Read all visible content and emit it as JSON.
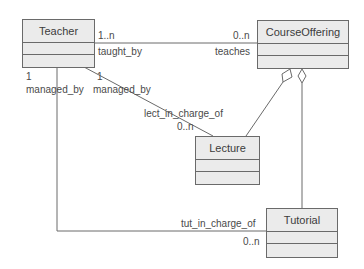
{
  "diagram": {
    "type": "uml-class",
    "classes": [
      {
        "id": "teacher",
        "name": "Teacher"
      },
      {
        "id": "course_offering",
        "name": "CourseOffering"
      },
      {
        "id": "lecture",
        "name": "Lecture"
      },
      {
        "id": "tutorial",
        "name": "Tutorial"
      }
    ],
    "associations": [
      {
        "id": "teaches",
        "from": "Teacher",
        "to": "CourseOffering",
        "from_role": "taught_by",
        "from_mult": "1..n",
        "to_role": "teaches",
        "to_mult": "0..n"
      },
      {
        "id": "lecture_assoc",
        "from": "Teacher",
        "to": "Lecture",
        "from_role": "managed_by",
        "from_mult": "1",
        "to_role": "lect_in_charge_of",
        "to_mult": "0..n"
      },
      {
        "id": "tutorial_assoc",
        "from": "Teacher",
        "to": "Tutorial",
        "from_role": "managed_by",
        "from_mult": "1",
        "to_role": "tut_in_charge_of",
        "to_mult": "0..n"
      },
      {
        "id": "agg_lecture",
        "kind": "aggregation",
        "whole": "CourseOffering",
        "part": "Lecture"
      },
      {
        "id": "agg_tutorial",
        "kind": "aggregation",
        "whole": "CourseOffering",
        "part": "Tutorial"
      }
    ]
  },
  "labels": {
    "teacher_co_mult_left": "1..n",
    "teacher_co_role_left": "taught_by",
    "teacher_co_mult_right": "0..n",
    "teacher_co_role_right": "teaches",
    "tutorial_teacher_mult": "1",
    "tutorial_teacher_role": "managed_by",
    "lecture_teacher_mult": "1",
    "lecture_teacher_role": "managed_by",
    "lecture_role": "lect_in_charge_of",
    "lecture_mult": "0..n",
    "tutorial_role": "tut_in_charge_of",
    "tutorial_mult": "0..n"
  },
  "colors": {
    "box_fill": "#ebebeb",
    "stroke": "#6a6a6a",
    "text": "#4a4a4a"
  }
}
